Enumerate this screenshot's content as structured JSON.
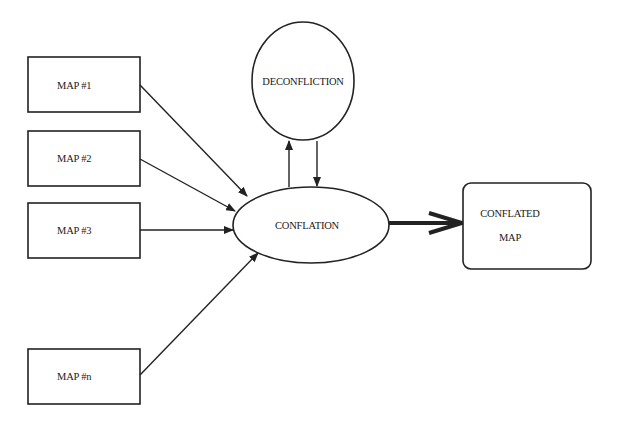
{
  "diagram": {
    "type": "flow",
    "title": "",
    "colors": {
      "background": "#ffffff",
      "stroke": "#222222",
      "text": "#1a1a1a"
    },
    "inputs": [
      {
        "id": "map1",
        "label": "MAP #1"
      },
      {
        "id": "map2",
        "label": "MAP #2"
      },
      {
        "id": "map3",
        "label": "MAP #3"
      },
      {
        "id": "mapn",
        "label": "MAP #n"
      }
    ],
    "process": {
      "id": "conflation",
      "label": "CONFLATION"
    },
    "loop": {
      "id": "deconfliction",
      "label": "DECONFLICTION"
    },
    "output": {
      "id": "conflated-map",
      "label_line1": "CONFLATED",
      "label_line2": "MAP"
    },
    "edges": [
      {
        "from": "map1",
        "to": "conflation"
      },
      {
        "from": "map2",
        "to": "conflation"
      },
      {
        "from": "map3",
        "to": "conflation"
      },
      {
        "from": "mapn",
        "to": "conflation"
      },
      {
        "from": "conflation",
        "to": "deconfliction"
      },
      {
        "from": "deconfliction",
        "to": "conflation"
      },
      {
        "from": "conflation",
        "to": "conflated-map",
        "style": "thick"
      }
    ]
  }
}
